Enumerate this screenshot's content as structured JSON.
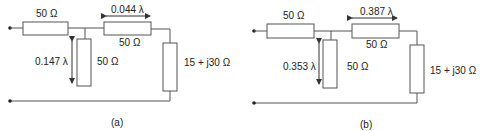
{
  "figures": [
    {
      "caption": "(a)",
      "series_resistor": "50 Ω",
      "line_length": "0.044 λ",
      "line_impedance": "50 Ω",
      "stub_length": "0.147 λ",
      "stub_impedance": "50 Ω",
      "load": "15 + j30 Ω"
    },
    {
      "caption": "(b)",
      "series_resistor": "50 Ω",
      "line_length": "0.387 λ",
      "line_impedance": "50 Ω",
      "stub_length": "0.353 λ",
      "stub_impedance": "50 Ω",
      "load": "15 + j30 Ω"
    }
  ],
  "colors": {
    "line": "#555555",
    "box_fill": "#ffffff",
    "text": "#222222"
  }
}
